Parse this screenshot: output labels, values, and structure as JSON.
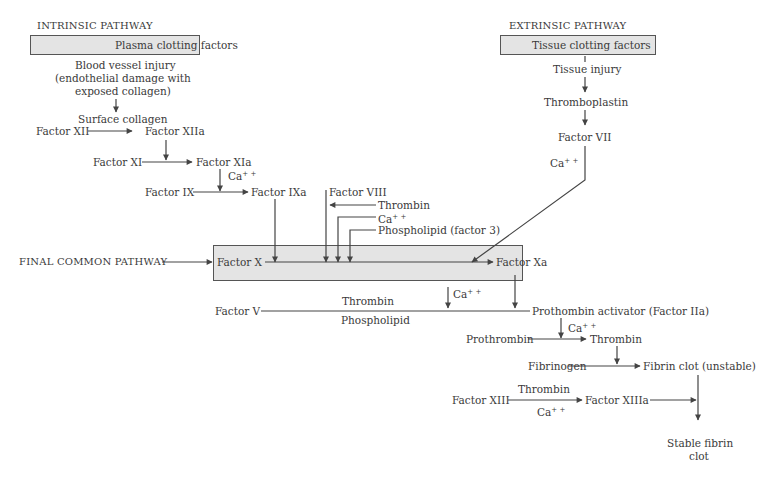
{
  "diagram": {
    "title_intrinsic": "INTRINSIC PATHWAY",
    "title_extrinsic": "EXTRINSIC PATHWAY",
    "title_common": "FINAL COMMON PATHWAY",
    "colors": {
      "line": "#444444",
      "text": "#3a3a3a",
      "box_fill": "#e4e4e4",
      "box_border": "#555555"
    },
    "intrinsic": {
      "box_label": "Plasma clotting factors",
      "injury_line1": "Blood vessel injury",
      "injury_line2": "(endothelial damage with",
      "injury_line3": "exposed collagen)",
      "surface_collagen": "Surface collagen",
      "factor_xii": "Factor XII",
      "factor_xiia": "Factor XIIa",
      "factor_xi": "Factor XI",
      "factor_xia": "Factor XIa",
      "ca_1": "Ca",
      "factor_ix": "Factor IX",
      "factor_ixa": "Factor IXa",
      "factor_viii": "Factor VIII",
      "thrombin": "Thrombin",
      "ca_2": "Ca",
      "phospholipid": "Phospholipid (factor 3)"
    },
    "extrinsic": {
      "box_label": "Tissue clotting factors",
      "tissue_injury": "Tissue injury",
      "thromboplastin": "Thromboplastin",
      "factor_vii": "Factor VII",
      "ca": "Ca"
    },
    "common": {
      "factor_x": "Factor X",
      "factor_xa": "Factor Xa",
      "ca_1": "Ca",
      "factor_v": "Factor V",
      "thrombin": "Thrombin",
      "phospholipid": "Phospholipid",
      "prothrombin_activator": "Prothombin activator (Factor IIa)",
      "ca_2": "Ca",
      "prothrombin": "Prothrombin",
      "thrombin_product": "Thrombin",
      "fibrinogen": "Fibrinogen",
      "fibrin_clot": "Fibrin clot (unstable)",
      "factor_xiii": "Factor XIII",
      "thrombin_xiii": "Thrombin",
      "ca_3": "Ca",
      "factor_xiiia": "Factor XIIIa",
      "stable_line1": "Stable fibrin",
      "stable_line2": "clot"
    },
    "superscript": "+ +"
  }
}
